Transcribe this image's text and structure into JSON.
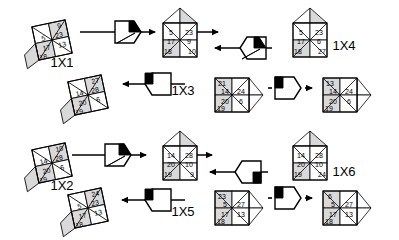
{
  "diagram": {
    "type": "cube-net-rotation-sequence",
    "background": "#ffffff",
    "stroke_color": "#000000",
    "face_shades": {
      "light": "#ffffff",
      "mid": "#d9d9d9",
      "dark": "#bfbfbf"
    },
    "labels": [
      {
        "id": "lbl-1x1",
        "text": "1X1",
        "x": 62,
        "y": 67
      },
      {
        "id": "lbl-1x4",
        "text": "1X4",
        "x": 344,
        "y": 50
      },
      {
        "id": "lbl-1x3",
        "text": "1X3",
        "x": 183,
        "y": 95
      },
      {
        "id": "lbl-1x2",
        "text": "1X2",
        "x": 62,
        "y": 190
      },
      {
        "id": "lbl-1x6",
        "text": "1X6",
        "x": 344,
        "y": 176
      },
      {
        "id": "lbl-1x5",
        "text": "1X5",
        "x": 183,
        "y": 216
      }
    ],
    "cubes": [
      {
        "id": "cube-1x1",
        "name": "cube-1x1",
        "cx": 52,
        "cy": 40,
        "orientation": "left-bottom-extrude",
        "numbers": {
          "top_right": "9",
          "upper_left": "5",
          "upper_right": "23",
          "lower_left": "17",
          "lower_right": "13",
          "bottom_left": "18"
        }
      },
      {
        "id": "cube-top-mid",
        "name": "cube-top-middle",
        "cx": 180,
        "cy": 40,
        "orientation": "square-with-peak",
        "numbers": {
          "upper_left": "5",
          "upper_right": "23",
          "lower_left": "17",
          "lower_right": "9",
          "bottom_left": "18",
          "bottom_right": "10"
        }
      },
      {
        "id": "cube-1x4",
        "name": "cube-1x4",
        "cx": 310,
        "cy": 40,
        "orientation": "square-with-peak",
        "numbers": {
          "upper_left": "5",
          "upper_right": "23",
          "lower_left": "17",
          "lower_right": "6",
          "bottom_left": "18",
          "bottom_right": "27"
        }
      },
      {
        "id": "cube-mid-left",
        "name": "cube-middle-left",
        "cx": 88,
        "cy": 95,
        "orientation": "left-bottom-extrude",
        "numbers": {
          "top_right": "27",
          "upper_left": "14",
          "upper_right": "28",
          "lower_left": "20",
          "lower_right": "6",
          "bottom_left": "19"
        }
      },
      {
        "id": "cube-1x3",
        "name": "cube-1x3",
        "cx": 232,
        "cy": 95,
        "orientation": "right-diamond",
        "numbers": {
          "top_left": "21",
          "upper_left": "14",
          "upper_right": "24",
          "lower_left": "20",
          "lower_right": "6",
          "bottom_left": "19"
        }
      },
      {
        "id": "cube-mid-right",
        "name": "cube-middle-right",
        "cx": 340,
        "cy": 95,
        "orientation": "right-diamond",
        "numbers": {
          "top_left": "13",
          "upper_left": "14",
          "upper_right": "24",
          "lower_left": "20",
          "lower_right": "6",
          "bottom_left": "19"
        }
      },
      {
        "id": "cube-1x2",
        "name": "cube-1x2",
        "cx": 52,
        "cy": 163,
        "orientation": "left-bottom-extrude",
        "numbers": {
          "top_right": "10",
          "upper_left": "14",
          "upper_right": "28",
          "lower_left": "20",
          "lower_right": "6",
          "bottom_left": "19"
        }
      },
      {
        "id": "cube-bot-mid",
        "name": "cube-bottom-middle",
        "cx": 180,
        "cy": 163,
        "orientation": "square-with-peak",
        "numbers": {
          "upper_left": "14",
          "upper_right": "28",
          "lower_left": "20",
          "lower_right": "10",
          "bottom_left": "19",
          "bottom_right": "9"
        }
      },
      {
        "id": "cube-1x6",
        "name": "cube-1x6",
        "cx": 310,
        "cy": 163,
        "orientation": "square-with-peak",
        "numbers": {
          "upper_left": "14",
          "upper_right": "28",
          "lower_left": "20",
          "lower_right": "10",
          "bottom_left": "19",
          "bottom_right": "24"
        }
      },
      {
        "id": "cube-bot-left",
        "name": "cube-bottom-left",
        "cx": 88,
        "cy": 208,
        "orientation": "left-bottom-extrude",
        "numbers": {
          "top_right": "24",
          "upper_left": "5",
          "upper_right": "23",
          "lower_left": "17",
          "lower_right": "13",
          "bottom_left": "18"
        }
      },
      {
        "id": "cube-1x5",
        "name": "cube-1x5",
        "cx": 232,
        "cy": 208,
        "orientation": "right-diamond",
        "numbers": {
          "top_left": "23",
          "upper_left": "5",
          "upper_right": "27",
          "lower_left": "17",
          "lower_right": "13",
          "bottom_left": "18"
        }
      },
      {
        "id": "cube-bot-right",
        "name": "cube-bottom-right",
        "cx": 340,
        "cy": 208,
        "orientation": "right-diamond",
        "numbers": {
          "top_left": "6",
          "upper_left": "5",
          "upper_right": "27",
          "lower_left": "17",
          "lower_right": "13",
          "bottom_left": "18"
        }
      }
    ],
    "operators": [
      {
        "id": "op-1",
        "name": "rotation-op-top-left",
        "cx": 128,
        "cy": 32,
        "flip": false,
        "wedge": "top-right-black"
      },
      {
        "id": "op-2",
        "name": "rotation-op-top-right",
        "cx": 253,
        "cy": 48,
        "flip": true,
        "wedge": "top-right-black"
      },
      {
        "id": "op-3",
        "name": "rotation-op-mid-left",
        "cx": 158,
        "cy": 84,
        "flip": true,
        "wedge": "top-left-black"
      },
      {
        "id": "op-4",
        "name": "rotation-op-mid-right",
        "cx": 288,
        "cy": 88,
        "flip": false,
        "wedge": "top-left-black"
      },
      {
        "id": "op-5",
        "name": "rotation-op-bot-left",
        "cx": 118,
        "cy": 155,
        "flip": false,
        "wedge": "top-right-black"
      },
      {
        "id": "op-6",
        "name": "rotation-op-bot-right",
        "cx": 248,
        "cy": 172,
        "flip": true,
        "wedge": "bottom-right-black"
      },
      {
        "id": "op-7",
        "name": "rotation-op-bot2-left",
        "cx": 158,
        "cy": 200,
        "flip": true,
        "wedge": "top-left-black"
      },
      {
        "id": "op-8",
        "name": "rotation-op-bot2-right",
        "cx": 288,
        "cy": 198,
        "flip": false,
        "wedge": "top-left-black"
      }
    ],
    "arrows": [
      {
        "id": "arrow-1",
        "name": "arrow-right-top-1",
        "x1": 80,
        "y1": 32,
        "x2": 155,
        "y2": 32,
        "dir": "right"
      },
      {
        "id": "arrow-2",
        "name": "arrow-right-top-2",
        "x1": 185,
        "y1": 32,
        "x2": 218,
        "y2": 32,
        "dir": "right"
      },
      {
        "id": "arrow-3",
        "name": "arrow-left-top-3",
        "x1": 272,
        "y1": 48,
        "x2": 215,
        "y2": 48,
        "dir": "left"
      },
      {
        "id": "arrow-4",
        "name": "arrow-left-mid-1",
        "x1": 185,
        "y1": 84,
        "x2": 123,
        "y2": 84,
        "dir": "left"
      },
      {
        "id": "arrow-5",
        "name": "arrow-right-mid-2",
        "x1": 268,
        "y1": 88,
        "x2": 272,
        "y2": 88,
        "dir": "none"
      },
      {
        "id": "arrow-6",
        "name": "arrow-right-mid-3",
        "x1": 305,
        "y1": 88,
        "x2": 312,
        "y2": 88,
        "dir": "right"
      },
      {
        "id": "arrow-7",
        "name": "arrow-right-bot-1",
        "x1": 72,
        "y1": 155,
        "x2": 146,
        "y2": 155,
        "dir": "right"
      },
      {
        "id": "arrow-8",
        "name": "arrow-right-bot-2",
        "x1": 175,
        "y1": 155,
        "x2": 212,
        "y2": 155,
        "dir": "right"
      },
      {
        "id": "arrow-9",
        "name": "arrow-left-bot-3",
        "x1": 268,
        "y1": 172,
        "x2": 210,
        "y2": 172,
        "dir": "left"
      },
      {
        "id": "arrow-10",
        "name": "arrow-left-bot2-1",
        "x1": 185,
        "y1": 200,
        "x2": 122,
        "y2": 200,
        "dir": "left"
      },
      {
        "id": "arrow-11",
        "name": "arrow-right-bot2-2",
        "x1": 268,
        "y1": 198,
        "x2": 272,
        "y2": 198,
        "dir": "none"
      },
      {
        "id": "arrow-12",
        "name": "arrow-right-bot2-3",
        "x1": 305,
        "y1": 198,
        "x2": 312,
        "y2": 198,
        "dir": "right"
      }
    ]
  }
}
